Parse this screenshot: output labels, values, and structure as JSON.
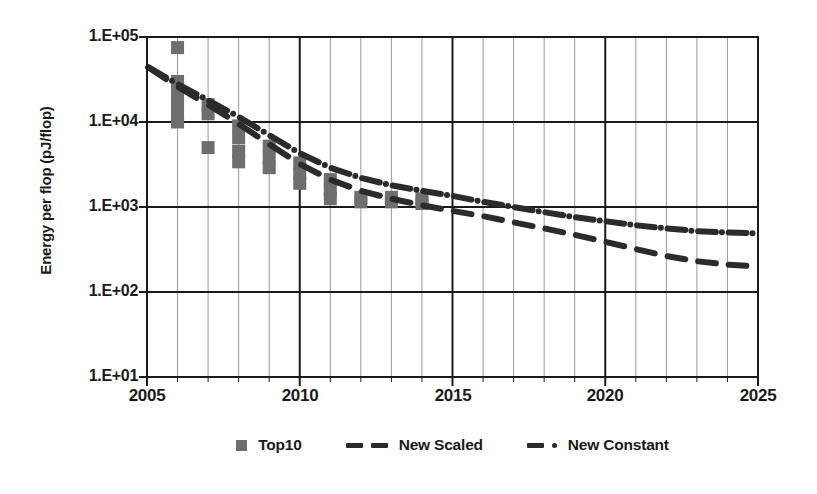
{
  "chart_data": {
    "type": "scatter",
    "title": "",
    "xlabel": "",
    "ylabel": "Energy per flop (pJ/flop)",
    "xlim": [
      2005,
      2025
    ],
    "ylim": [
      10,
      100000
    ],
    "yscale": "log",
    "grid": true,
    "legend_position": "bottom",
    "x_ticks": [
      2005,
      2010,
      2015,
      2020,
      2025
    ],
    "x_tick_labels": [
      "2005",
      "2010",
      "2015",
      "2020",
      "2025"
    ],
    "x_minor_step": 1,
    "y_ticks": [
      100000,
      10000,
      1000,
      100,
      10
    ],
    "y_tick_labels": [
      "1.E+05",
      "1.E+04",
      "1.E+03",
      "1.E+02",
      "1.E+01"
    ],
    "series": [
      {
        "name": "Top10",
        "type": "scatter",
        "marker": "square",
        "color": "#6e6e6e",
        "points": [
          {
            "x": 2006.0,
            "y": 75000
          },
          {
            "x": 2006.0,
            "y": 30000
          },
          {
            "x": 2006.0,
            "y": 22000
          },
          {
            "x": 2006.0,
            "y": 16000
          },
          {
            "x": 2006.0,
            "y": 12000
          },
          {
            "x": 2006.0,
            "y": 10000
          },
          {
            "x": 2007.0,
            "y": 16000
          },
          {
            "x": 2007.0,
            "y": 12500
          },
          {
            "x": 2007.0,
            "y": 5000
          },
          {
            "x": 2008.0,
            "y": 9000
          },
          {
            "x": 2008.0,
            "y": 6500
          },
          {
            "x": 2008.0,
            "y": 4500
          },
          {
            "x": 2008.0,
            "y": 3400
          },
          {
            "x": 2009.0,
            "y": 5200
          },
          {
            "x": 2009.0,
            "y": 3800
          },
          {
            "x": 2009.0,
            "y": 2900
          },
          {
            "x": 2010.0,
            "y": 3300
          },
          {
            "x": 2010.0,
            "y": 2500
          },
          {
            "x": 2010.0,
            "y": 1900
          },
          {
            "x": 2011.0,
            "y": 2100
          },
          {
            "x": 2011.0,
            "y": 1600
          },
          {
            "x": 2011.0,
            "y": 1250
          },
          {
            "x": 2012.0,
            "y": 1300
          },
          {
            "x": 2012.0,
            "y": 1150
          },
          {
            "x": 2013.0,
            "y": 1300
          },
          {
            "x": 2013.0,
            "y": 1150
          },
          {
            "x": 2014.0,
            "y": 1250
          },
          {
            "x": 2014.0,
            "y": 1100
          }
        ]
      },
      {
        "name": "New Scaled",
        "type": "line",
        "linestyle": "dashed",
        "color": "#2b2b2b",
        "points": [
          {
            "x": 2005.0,
            "y": 45000
          },
          {
            "x": 2006.0,
            "y": 26000
          },
          {
            "x": 2007.0,
            "y": 16000
          },
          {
            "x": 2008.0,
            "y": 9500
          },
          {
            "x": 2009.0,
            "y": 5500
          },
          {
            "x": 2010.0,
            "y": 3200
          },
          {
            "x": 2011.0,
            "y": 2100
          },
          {
            "x": 2012.0,
            "y": 1550
          },
          {
            "x": 2013.0,
            "y": 1250
          },
          {
            "x": 2014.0,
            "y": 1050
          },
          {
            "x": 2015.0,
            "y": 900
          },
          {
            "x": 2016.0,
            "y": 780
          },
          {
            "x": 2017.0,
            "y": 660
          },
          {
            "x": 2018.0,
            "y": 560
          },
          {
            "x": 2019.0,
            "y": 470
          },
          {
            "x": 2020.0,
            "y": 390
          },
          {
            "x": 2021.0,
            "y": 320
          },
          {
            "x": 2022.0,
            "y": 265
          },
          {
            "x": 2023.0,
            "y": 230
          },
          {
            "x": 2024.0,
            "y": 210
          },
          {
            "x": 2025.0,
            "y": 200
          }
        ]
      },
      {
        "name": "New Constant",
        "type": "line",
        "linestyle": "dashdot",
        "color": "#2b2b2b",
        "points": [
          {
            "x": 2005.0,
            "y": 45000
          },
          {
            "x": 2006.0,
            "y": 28000
          },
          {
            "x": 2007.0,
            "y": 18000
          },
          {
            "x": 2008.0,
            "y": 11500
          },
          {
            "x": 2009.0,
            "y": 7000
          },
          {
            "x": 2010.0,
            "y": 4300
          },
          {
            "x": 2011.0,
            "y": 2900
          },
          {
            "x": 2012.0,
            "y": 2200
          },
          {
            "x": 2013.0,
            "y": 1800
          },
          {
            "x": 2014.0,
            "y": 1550
          },
          {
            "x": 2015.0,
            "y": 1350
          },
          {
            "x": 2016.0,
            "y": 1150
          },
          {
            "x": 2017.0,
            "y": 1000
          },
          {
            "x": 2018.0,
            "y": 870
          },
          {
            "x": 2019.0,
            "y": 760
          },
          {
            "x": 2020.0,
            "y": 680
          },
          {
            "x": 2021.0,
            "y": 610
          },
          {
            "x": 2022.0,
            "y": 560
          },
          {
            "x": 2023.0,
            "y": 520
          },
          {
            "x": 2024.0,
            "y": 500
          },
          {
            "x": 2025.0,
            "y": 490
          }
        ]
      }
    ]
  },
  "axis": {
    "y_title": "Energy per flop (pJ/flop)",
    "y_labels": [
      "1.E+05",
      "1.E+04",
      "1.E+03",
      "1.E+02",
      "1.E+01"
    ],
    "x_labels": [
      "2005",
      "2010",
      "2015",
      "2020",
      "2025"
    ]
  },
  "legend": {
    "items": [
      {
        "label": "Top10",
        "marker": "square-marker"
      },
      {
        "label": "New Scaled",
        "marker": "dashed-line"
      },
      {
        "label": "New Constant",
        "marker": "dash-dot-line"
      }
    ]
  },
  "colors": {
    "marker": "#6e6e6e",
    "line": "#2b2b2b",
    "axis": "#1a1a1a",
    "minor_grid": "#9a9a9a",
    "background": "#ffffff"
  }
}
